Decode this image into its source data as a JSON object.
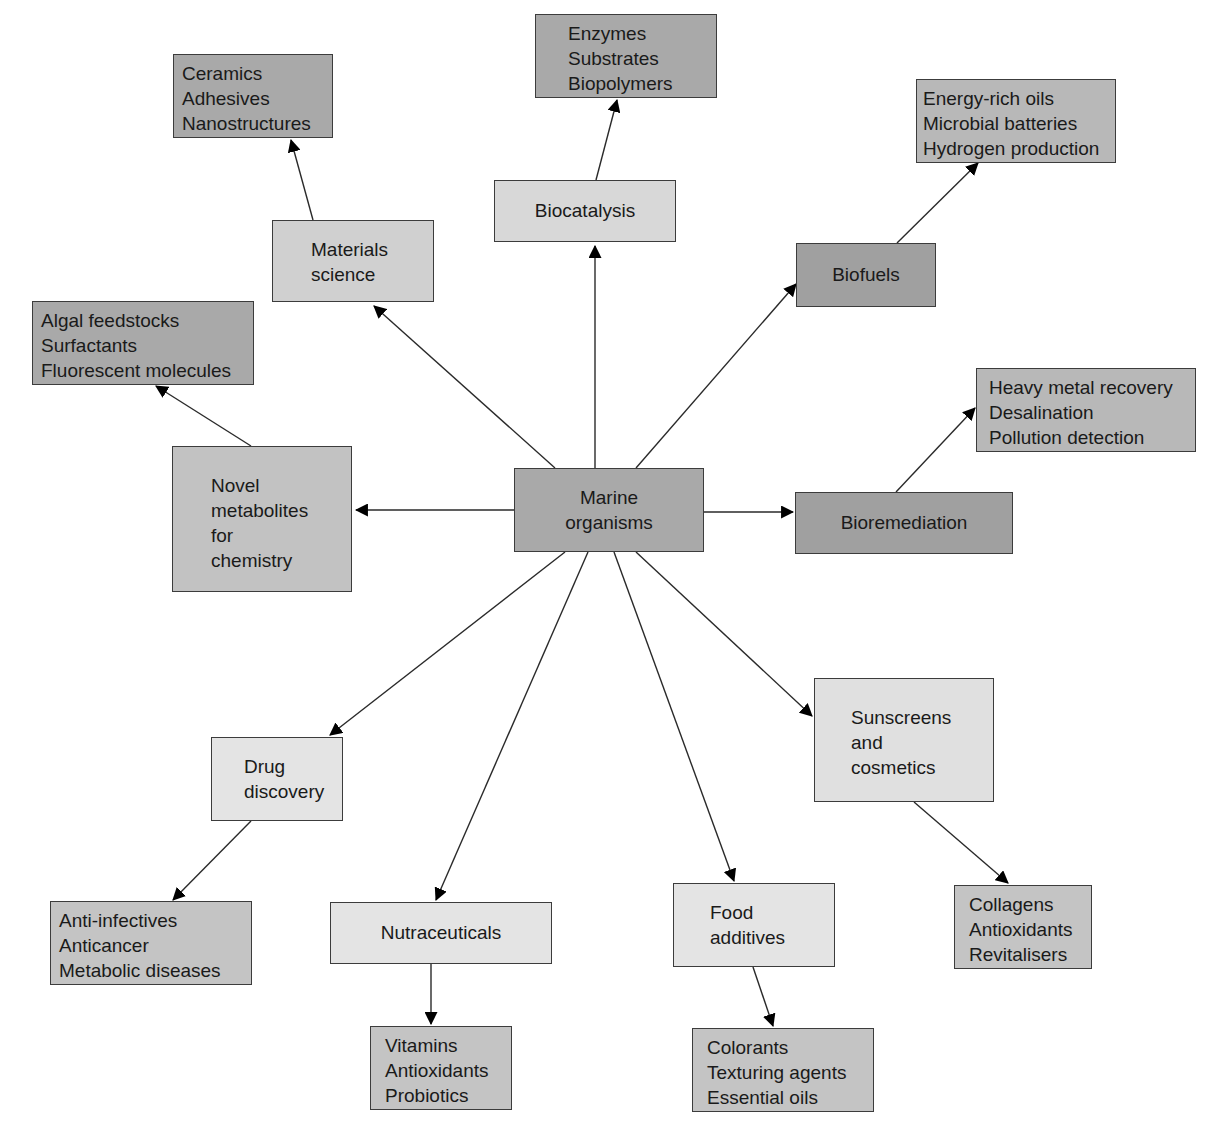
{
  "diagram": {
    "center": {
      "id": "marine",
      "lines": [
        "Marine",
        "organisms"
      ],
      "box": [
        514,
        468,
        190,
        84
      ],
      "fill": "#a9a9a9",
      "align": "center"
    },
    "nodes": [
      {
        "id": "materials",
        "lines": [
          "Materials",
          "science"
        ],
        "box": [
          272,
          220,
          162,
          82
        ],
        "fill": "#d0d0d0",
        "align": "left",
        "pad": [
          38,
          16
        ]
      },
      {
        "id": "materials_details",
        "lines": [
          "Ceramics",
          "Adhesives",
          "Nanostructures"
        ],
        "box": [
          173,
          54,
          160,
          84
        ],
        "fill": "#a9a9a9",
        "align": "left",
        "pad": [
          8,
          6
        ]
      },
      {
        "id": "biocatalysis",
        "lines": [
          "Biocatalysis"
        ],
        "box": [
          494,
          180,
          182,
          62
        ],
        "fill": "#d8d8d8",
        "align": "center"
      },
      {
        "id": "biocatalysis_details",
        "lines": [
          "Enzymes",
          "Substrates",
          "Biopolymers"
        ],
        "box": [
          535,
          14,
          182,
          84
        ],
        "fill": "#a9a9a9",
        "align": "left",
        "pad": [
          32,
          6
        ]
      },
      {
        "id": "biofuels",
        "lines": [
          "Biofuels"
        ],
        "box": [
          796,
          243,
          140,
          64
        ],
        "fill": "#a0a0a0",
        "align": "center"
      },
      {
        "id": "biofuels_details",
        "lines": [
          "Energy-rich oils",
          "Microbial batteries",
          "Hydrogen production"
        ],
        "box": [
          916,
          79,
          200,
          84
        ],
        "fill": "#b8b8b8",
        "align": "left",
        "pad": [
          6,
          6
        ]
      },
      {
        "id": "bioremediation",
        "lines": [
          "Bioremediation"
        ],
        "box": [
          795,
          492,
          218,
          62
        ],
        "fill": "#a0a0a0",
        "align": "center"
      },
      {
        "id": "bioremediation_details",
        "lines": [
          "Heavy metal recovery",
          "Desalination",
          "Pollution detection"
        ],
        "box": [
          976,
          368,
          220,
          84
        ],
        "fill": "#b8b8b8",
        "align": "left",
        "pad": [
          12,
          6
        ]
      },
      {
        "id": "novel_metabolites",
        "lines": [
          "Novel",
          "metabolites",
          "for",
          "chemistry"
        ],
        "box": [
          172,
          446,
          180,
          146
        ],
        "fill": "#c2c2c2",
        "align": "left",
        "pad": [
          38,
          26
        ]
      },
      {
        "id": "novel_metabolites_details",
        "lines": [
          "Algal feedstocks",
          "Surfactants",
          "Fluorescent molecules"
        ],
        "box": [
          32,
          301,
          222,
          84
        ],
        "fill": "#a9a9a9",
        "align": "left",
        "pad": [
          8,
          6
        ]
      },
      {
        "id": "drug_discovery",
        "lines": [
          "Drug",
          "discovery"
        ],
        "box": [
          211,
          737,
          132,
          84
        ],
        "fill": "#e4e4e4",
        "align": "left",
        "pad": [
          32,
          16
        ]
      },
      {
        "id": "drug_discovery_details",
        "lines": [
          "Anti-infectives",
          "Anticancer",
          "Metabolic diseases"
        ],
        "box": [
          50,
          901,
          202,
          84
        ],
        "fill": "#c4c4c4",
        "align": "left",
        "pad": [
          8,
          6
        ]
      },
      {
        "id": "nutraceuticals",
        "lines": [
          "Nutraceuticals"
        ],
        "box": [
          330,
          902,
          222,
          62
        ],
        "fill": "#e4e4e4",
        "align": "center"
      },
      {
        "id": "nutraceuticals_details",
        "lines": [
          "Vitamins",
          "Antioxidants",
          "Probiotics"
        ],
        "box": [
          370,
          1026,
          142,
          84
        ],
        "fill": "#c4c4c4",
        "align": "left",
        "pad": [
          14,
          6
        ]
      },
      {
        "id": "food_additives",
        "lines": [
          "Food",
          "additives"
        ],
        "box": [
          673,
          883,
          162,
          84
        ],
        "fill": "#e4e4e4",
        "align": "left",
        "pad": [
          36,
          16
        ]
      },
      {
        "id": "food_additives_details",
        "lines": [
          "Colorants",
          "Texturing agents",
          "Essential oils"
        ],
        "box": [
          692,
          1028,
          182,
          84
        ],
        "fill": "#c4c4c4",
        "align": "left",
        "pad": [
          14,
          6
        ]
      },
      {
        "id": "sunscreens",
        "lines": [
          "Sunscreens",
          "and",
          "cosmetics"
        ],
        "box": [
          814,
          678,
          180,
          124
        ],
        "fill": "#e0e0e0",
        "align": "left",
        "pad": [
          36,
          26
        ]
      },
      {
        "id": "sunscreens_details",
        "lines": [
          "Collagens",
          "Antioxidants",
          "Revitalisers"
        ],
        "box": [
          954,
          885,
          138,
          84
        ],
        "fill": "#c4c4c4",
        "align": "left",
        "pad": [
          14,
          6
        ]
      }
    ],
    "edges": [
      {
        "from": "marine",
        "to": "materials",
        "line": [
          555,
          468,
          374,
          306
        ]
      },
      {
        "from": "marine",
        "to": "biocatalysis",
        "line": [
          595,
          468,
          595,
          246
        ]
      },
      {
        "from": "marine",
        "to": "biofuels",
        "line": [
          636,
          468,
          796,
          284
        ]
      },
      {
        "from": "marine",
        "to": "bioremediation",
        "line": [
          704,
          512,
          793,
          512
        ]
      },
      {
        "from": "marine",
        "to": "novel_metabolites",
        "line": [
          514,
          510,
          356,
          510
        ]
      },
      {
        "from": "marine",
        "to": "drug_discovery",
        "line": [
          565,
          552,
          330,
          735
        ]
      },
      {
        "from": "marine",
        "to": "nutraceuticals",
        "line": [
          588,
          552,
          436,
          900
        ]
      },
      {
        "from": "marine",
        "to": "food_additives",
        "line": [
          614,
          552,
          734,
          881
        ]
      },
      {
        "from": "marine",
        "to": "sunscreens",
        "line": [
          636,
          552,
          812,
          716
        ]
      },
      {
        "from": "materials",
        "to": "materials_details",
        "line": [
          313,
          220,
          291,
          140
        ]
      },
      {
        "from": "biocatalysis",
        "to": "biocatalysis_details",
        "line": [
          596,
          180,
          617,
          100
        ]
      },
      {
        "from": "biofuels",
        "to": "biofuels_details",
        "line": [
          897,
          243,
          978,
          163
        ]
      },
      {
        "from": "bioremediation",
        "to": "bioremediation_details",
        "line": [
          896,
          492,
          975,
          408
        ]
      },
      {
        "from": "novel_metabolites",
        "to": "novel_metabolites_details",
        "line": [
          251,
          446,
          156,
          386
        ]
      },
      {
        "from": "drug_discovery",
        "to": "drug_discovery_details",
        "line": [
          251,
          821,
          173,
          900
        ]
      },
      {
        "from": "nutraceuticals",
        "to": "nutraceuticals_details",
        "line": [
          431,
          964,
          431,
          1024
        ]
      },
      {
        "from": "food_additives",
        "to": "food_additives_details",
        "line": [
          753,
          967,
          773,
          1026
        ]
      },
      {
        "from": "sunscreens",
        "to": "sunscreens_details",
        "line": [
          914,
          802,
          1008,
          883
        ]
      }
    ],
    "edge_color": "#2a2a2a",
    "arrowhead": "filled-triangle"
  }
}
